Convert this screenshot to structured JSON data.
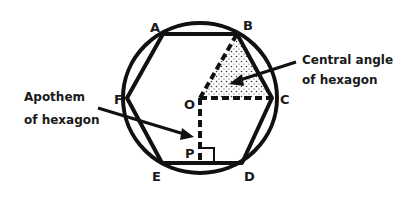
{
  "diagram": {
    "points": {
      "A": "A",
      "B": "B",
      "C": "C",
      "D": "D",
      "E": "E",
      "F": "F",
      "O": "O",
      "P": "P"
    },
    "annotations": {
      "central_angle": {
        "line1": "Central angle",
        "line2": "of hexagon"
      },
      "apothem": {
        "line1": "Apothem",
        "line2": "of hexagon"
      }
    },
    "colors": {
      "stroke": "#111111",
      "background": "#ffffff",
      "shading": "#333333"
    }
  }
}
